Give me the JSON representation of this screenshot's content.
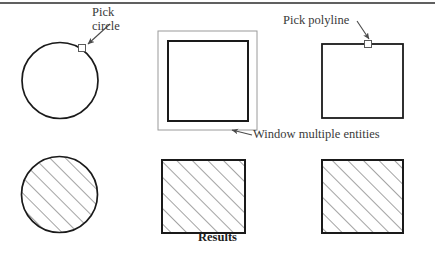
{
  "figure": {
    "width": 435,
    "height": 255,
    "background": "#ffffff",
    "top_rule_color": "#2b2b2b"
  },
  "labels": {
    "pick_circle_line1": "Pick",
    "pick_circle_line2": "circle",
    "pick_polyline": "Pick polyline",
    "window_multiple": "Window multiple entities",
    "results": "Results"
  },
  "colors": {
    "outline": "#1a1a1a",
    "window_rect": "#9a9a9a",
    "hatch": "#555555",
    "leader": "#4a4a4a",
    "text": "#3a3a3a",
    "results_text": "#1d1d1d",
    "pick_box_stroke": "#5a5a5a"
  },
  "shapes": {
    "top_row": [
      {
        "name": "circle-unselected",
        "type": "circle",
        "cx": 60,
        "cy": 80.5,
        "r": 38,
        "hatched": false,
        "pick_box": {
          "x": 82,
          "y": 48,
          "size": 7
        }
      },
      {
        "name": "square-unselected-windowed",
        "type": "square",
        "x": 168,
        "y": 41,
        "width": 80,
        "height": 80,
        "hatched": false,
        "window_rect": {
          "x": 158,
          "y": 31,
          "width": 99,
          "height": 99
        }
      },
      {
        "name": "square-unselected-picked",
        "type": "square",
        "x": 322,
        "y": 44,
        "width": 81,
        "height": 74,
        "hatched": false,
        "pick_box": {
          "x": 364,
          "y": 40,
          "size": 7
        }
      }
    ],
    "bottom_row": [
      {
        "name": "circle-selected",
        "type": "circle",
        "cx": 59.5,
        "cy": 194.5,
        "r": 38,
        "hatched": true
      },
      {
        "name": "square-selected-middle",
        "type": "square",
        "x": 162,
        "y": 160,
        "width": 83,
        "height": 73,
        "hatched": true
      },
      {
        "name": "square-selected-right",
        "type": "square",
        "x": 322,
        "y": 160,
        "width": 81,
        "height": 73,
        "hatched": true
      }
    ]
  },
  "leaders": [
    {
      "name": "leader-pick-circle",
      "from": [
        110,
        24
      ],
      "to": [
        86,
        45
      ]
    },
    {
      "name": "leader-pick-polyline",
      "from": [
        358,
        22
      ],
      "to": [
        370,
        41
      ]
    },
    {
      "name": "leader-window",
      "from": [
        251,
        134
      ],
      "to": [
        230,
        130
      ]
    }
  ],
  "hatch": {
    "angle_degrees": 45,
    "spacing_px": 11,
    "direction": "lower-left to upper-right"
  }
}
